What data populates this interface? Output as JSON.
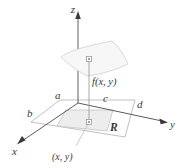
{
  "figure": {
    "type": "math-diagram-3d"
  },
  "axes": {
    "z_label": "z",
    "y_label": "y",
    "x_label": "x"
  },
  "bounds": {
    "a": "a",
    "b": "b",
    "c": "c",
    "d": "d"
  },
  "labels": {
    "function_value": "f(x, y)",
    "region": "R",
    "base_point": "(x, y)"
  },
  "colors": {
    "line": "#595959",
    "axis": "#4a4a4a",
    "surface_fill": "#f4f4f4",
    "surface_stroke": "#c9c9c9",
    "region_fill": "#ededed",
    "region_stroke": "#bdbdbd",
    "plane_stroke": "#9a9a9a",
    "text": "#3a3a3a",
    "marker": "#8c8c8c",
    "background": "#ffffff"
  }
}
